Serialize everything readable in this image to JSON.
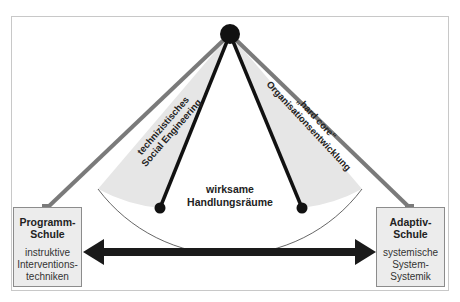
{
  "diagram": {
    "apex": {
      "shape": "circle",
      "color": "#111111"
    },
    "left_sector_label": {
      "line1": "technizistisches",
      "line2": "Social Engineering"
    },
    "right_sector_label": {
      "line1": "„hard core“",
      "line2": "Organisationsentwicklung"
    },
    "center_label": {
      "line1": "wirksame",
      "line2": "Handlungsräume"
    },
    "left_box": {
      "title_line1": "Programm-",
      "title_line2": "Schule",
      "desc_line1": "instruktive",
      "desc_line2": "Interventions-",
      "desc_line3": "techniken"
    },
    "right_box": {
      "title_line1": "Adaptiv-",
      "title_line2": "Schule",
      "desc_line1": "systemische",
      "desc_line2": "System-",
      "desc_line3": "Systemik"
    },
    "connector": {
      "type": "double-headed-arrow",
      "color": "#1a1a1a"
    },
    "colors": {
      "outer_line": "#7a7a7a",
      "inner_line": "#111111",
      "sector_fill": "#e6e6e6",
      "box_fill": "#ececec",
      "frame": "#c8c8c8"
    }
  }
}
